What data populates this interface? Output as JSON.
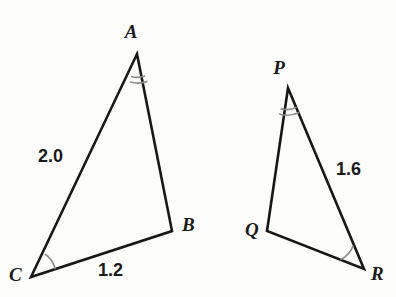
{
  "figure": {
    "background_color": "#fdfdfc",
    "stroke_color": "#171717",
    "arc_color": "#8d8d8d"
  },
  "triangles": [
    {
      "name": "triangle-abc",
      "vertices": [
        {
          "key": "A",
          "label": "A",
          "x": 137,
          "y": 54,
          "label_x": 131,
          "label_y": 38,
          "marks": 2
        },
        {
          "key": "B",
          "label": "B",
          "x": 172,
          "y": 231,
          "label_x": 182,
          "label_y": 231,
          "marks": 0
        },
        {
          "key": "C",
          "label": "C",
          "x": 31,
          "y": 277,
          "label_x": 9,
          "label_y": 281,
          "marks": 1
        }
      ],
      "sides": [
        {
          "key": "CA",
          "label": "2.0",
          "label_x": 38,
          "label_y": 162
        },
        {
          "key": "CB",
          "label": "1.2",
          "label_x": 98,
          "label_y": 276
        }
      ]
    },
    {
      "name": "triangle-pqr",
      "vertices": [
        {
          "key": "P",
          "label": "P",
          "x": 288,
          "y": 88,
          "label_x": 279,
          "label_y": 74,
          "marks": 2
        },
        {
          "key": "Q",
          "label": "Q",
          "x": 267,
          "y": 231,
          "label_x": 245,
          "label_y": 236,
          "marks": 0
        },
        {
          "key": "R",
          "label": "R",
          "x": 364,
          "y": 269,
          "label_x": 371,
          "label_y": 280,
          "marks": 1
        }
      ],
      "sides": [
        {
          "key": "PR",
          "label": "1.6",
          "label_x": 336,
          "label_y": 175
        }
      ]
    }
  ],
  "labels": {
    "vertex_a": "A",
    "vertex_b": "B",
    "vertex_c": "C",
    "vertex_p": "P",
    "vertex_q": "Q",
    "vertex_r": "R",
    "side_ca": "2.0",
    "side_cb": "1.2",
    "side_pr": "1.6"
  }
}
